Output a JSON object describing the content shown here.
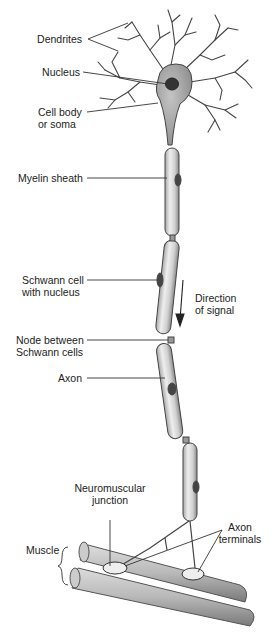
{
  "labels": {
    "dendrites": "Dendrites",
    "nucleus": "Nucleus",
    "cell_body_1": "Cell body",
    "cell_body_2": "or soma",
    "myelin": "Myelin sheath",
    "schwann_1": "Schwann cell",
    "schwann_2": "with nucleus",
    "direction_1": "Direction",
    "direction_2": "of signal",
    "node_1": "Node between",
    "node_2": "Schwann cells",
    "axon": "Axon",
    "nmj_1": "Neuromuscular",
    "nmj_2": "junction",
    "terminals_1": "Axon",
    "terminals_2": "terminals",
    "muscle": "Muscle"
  },
  "colors": {
    "line": "#333333",
    "soma": "#9a9a9a",
    "myelin": "#d8d8d8",
    "nucleus": "#3a3a3a",
    "muscle": "#b0b0b0"
  }
}
